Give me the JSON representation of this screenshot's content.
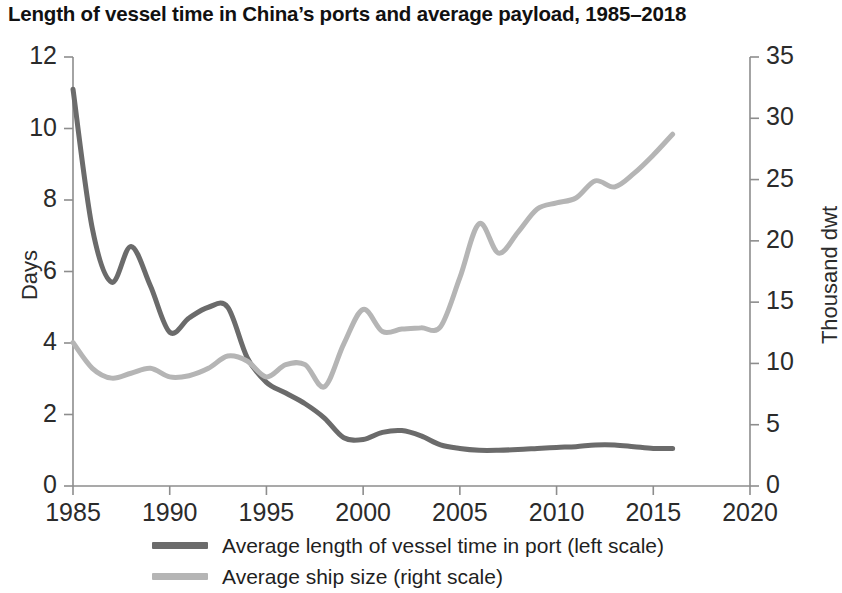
{
  "chart_data": {
    "type": "line",
    "title": "Length of vessel time in China’s ports and average payload, 1985–2018",
    "xlabel": "",
    "ylabel": "Days",
    "y2label": "Thousand dwt",
    "xlim": [
      1985,
      2020
    ],
    "ylim": [
      0,
      12
    ],
    "y2lim": [
      0,
      35
    ],
    "xticks": [
      "1985",
      "1990",
      "1995",
      "2000",
      "2005",
      "2010",
      "2015",
      "2020"
    ],
    "xtick_values": [
      1985,
      1990,
      1995,
      2000,
      2005,
      2010,
      2015,
      2020
    ],
    "yticks": [
      "0",
      "2",
      "4",
      "6",
      "8",
      "10",
      "12"
    ],
    "ytick_values": [
      0,
      2,
      4,
      6,
      8,
      10,
      12
    ],
    "y2ticks": [
      "0",
      "5",
      "10",
      "15",
      "20",
      "25",
      "30",
      "35"
    ],
    "y2tick_values": [
      0,
      5,
      10,
      15,
      20,
      25,
      30,
      35
    ],
    "grid": false,
    "legend_position": "bottom",
    "series": [
      {
        "name": "Average length of vessel time in port (left scale)",
        "axis": "left",
        "units": "days",
        "color": "#6b6b6b",
        "x": [
          1985,
          1986,
          1987,
          1988,
          1989,
          1990,
          1991,
          1992,
          1993,
          1994,
          1995,
          1996,
          1997,
          1998,
          1999,
          2000,
          2001,
          2002,
          2003,
          2004,
          2005,
          2006,
          2007,
          2008,
          2009,
          2010,
          2011,
          2012,
          2013,
          2014,
          2015,
          2016
        ],
        "values": [
          11.1,
          7.2,
          5.7,
          6.7,
          5.6,
          4.3,
          4.7,
          5.0,
          5.0,
          3.6,
          2.9,
          2.6,
          2.3,
          1.9,
          1.35,
          1.3,
          1.5,
          1.55,
          1.4,
          1.15,
          1.05,
          1.0,
          1.0,
          1.02,
          1.05,
          1.08,
          1.1,
          1.15,
          1.15,
          1.1,
          1.05,
          1.05
        ]
      },
      {
        "name": "Average ship size (right scale)",
        "axis": "right",
        "units": "thousand dwt",
        "color": "#b5b5b5",
        "x": [
          1985,
          1986,
          1987,
          1988,
          1989,
          1990,
          1991,
          1992,
          1993,
          1994,
          1995,
          1996,
          1997,
          1998,
          1999,
          2000,
          2001,
          2002,
          2003,
          2004,
          2005,
          2006,
          2007,
          2008,
          2009,
          2010,
          2011,
          2012,
          2013,
          2014,
          2015,
          2016
        ],
        "values": [
          11.7,
          9.6,
          8.8,
          9.2,
          9.6,
          8.9,
          9.0,
          9.6,
          10.6,
          10.2,
          8.9,
          9.9,
          9.9,
          8.1,
          11.6,
          14.4,
          12.6,
          12.8,
          12.9,
          13.0,
          17.0,
          21.4,
          19.0,
          20.7,
          22.6,
          23.1,
          23.5,
          24.9,
          24.4,
          25.5,
          27.0,
          28.7
        ]
      }
    ]
  }
}
